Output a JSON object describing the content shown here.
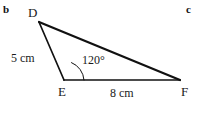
{
  "figure": {
    "type": "geometry-triangle-diagram",
    "background_color": "#ffffff",
    "stroke_color": "#111111",
    "width": 202,
    "height": 114,
    "part_tags": {
      "left": "b",
      "right": "c"
    },
    "shape": {
      "name": "triangle-DEF",
      "vertices": [
        {
          "label": "D",
          "x": 39,
          "y": 22
        },
        {
          "label": "E",
          "x": 64,
          "y": 80
        },
        {
          "label": "F",
          "x": 180,
          "y": 80
        }
      ],
      "edges": [
        {
          "name": "side-DE",
          "from": "D",
          "to": "E",
          "length_label": "5 cm"
        },
        {
          "name": "side-EF",
          "from": "E",
          "to": "F",
          "length_label": "8 cm"
        },
        {
          "name": "side-DF",
          "from": "D",
          "to": "F",
          "length_label": ""
        }
      ],
      "angles": [
        {
          "name": "angle-E",
          "at": "E",
          "label": "120°",
          "value": 120,
          "unit": "degrees",
          "marked": true
        }
      ]
    }
  },
  "labels": {
    "vertex_d": "D",
    "vertex_e": "E",
    "vertex_f": "F",
    "side_de": "5 cm",
    "side_ef": "8 cm",
    "angle_e": "120°"
  }
}
